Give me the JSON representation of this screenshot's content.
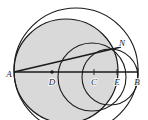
{
  "figure": {
    "canvas": {
      "width": 148,
      "height": 120,
      "background": "#ffffff"
    },
    "style": {
      "stroke_color": "#1a1a1a",
      "fill_shaded": "#d9d9d9",
      "fill_plain": "#ffffff",
      "stroke_width": 1.1,
      "thick_stroke_width": 1.6
    },
    "baseline": {
      "name": "segment-AB",
      "x1": 14,
      "y1": 72,
      "x2": 138,
      "y2": 72
    },
    "chord": {
      "name": "segment-AN",
      "x1": 14,
      "y1": 72,
      "x2": 121,
      "y2": 47
    },
    "circles": [
      {
        "name": "shaded-circle",
        "cx": 66,
        "cy": 71,
        "r": 52,
        "fill": "#d9d9d9",
        "stroke": "#1a1a1a"
      },
      {
        "name": "outer-circle",
        "cx": 76,
        "cy": 70,
        "r": 62,
        "fill": "none",
        "stroke": "#1a1a1a"
      },
      {
        "name": "inner-circle-on-CB",
        "cx": 92,
        "cy": 77,
        "r": 34,
        "fill": "none",
        "stroke": "#1a1a1a"
      },
      {
        "name": "small-circle-on-EB",
        "cx": 110,
        "cy": 77,
        "r": 28,
        "fill": "none",
        "stroke": "#1a1a1a"
      }
    ],
    "points": [
      {
        "id": "A",
        "label": "A",
        "x": 14,
        "y": 72,
        "label_x": 9,
        "label_y": 77,
        "dot": false
      },
      {
        "id": "D",
        "label": "D",
        "x": 52,
        "y": 72,
        "label_x": 49,
        "label_y": 84,
        "dot": true
      },
      {
        "id": "C",
        "label": "C",
        "x": 94,
        "y": 72,
        "label_x": 91,
        "label_y": 84,
        "dot": false
      },
      {
        "id": "E",
        "label": "E",
        "x": 117,
        "y": 72,
        "label_x": 114,
        "label_y": 84,
        "dot": false
      },
      {
        "id": "B",
        "label": "B",
        "x": 138,
        "y": 72,
        "label_x": 133,
        "label_y": 84,
        "dot": false
      },
      {
        "id": "N",
        "label": "N",
        "x": 121,
        "y": 47,
        "label_x": 119,
        "label_y": 45,
        "dot": false
      }
    ]
  }
}
